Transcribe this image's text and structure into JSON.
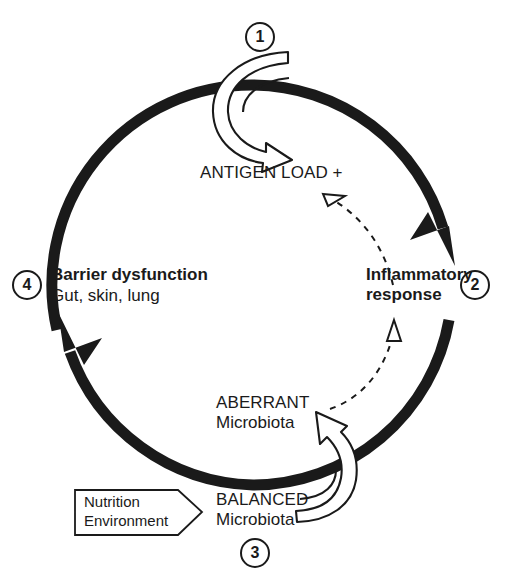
{
  "figure": {
    "type": "cycle-diagram",
    "background_color": "#ffffff",
    "ink_color": "#1a1a1a"
  },
  "steps": [
    {
      "number": "1",
      "label": "ANTIGEN LOAD +",
      "sublabel": "",
      "style": "caps",
      "position": "top"
    },
    {
      "number": "2",
      "label": "Inflammatory",
      "sublabel": "response",
      "style": "bold",
      "position": "right"
    },
    {
      "number": "3",
      "label": "BALANCED",
      "sublabel": "Microbiota",
      "style": "caps",
      "position": "bottom"
    },
    {
      "number": "4",
      "label": "Barrier dysfunction",
      "sublabel": "Gut, skin, lung",
      "style": "bold",
      "position": "left"
    }
  ],
  "nodes": {
    "antigen_load": "ANTIGEN LOAD +",
    "inflammatory_line1": "Inflammatory",
    "inflammatory_line2": "response",
    "aberrant_line1": "ABERRANT",
    "aberrant_line2": "Microbiota",
    "balanced_line1": "BALANCED",
    "balanced_line2": "Microbiota",
    "barrier_line1": "Barrier dysfunction",
    "barrier_line2": "Gut, skin, lung"
  },
  "input_box": {
    "line1": "Nutrition",
    "line2": "Environment",
    "shape": "arrow-right-pentagon"
  },
  "numbers": {
    "one": "1",
    "two": "2",
    "three": "3",
    "four": "4"
  },
  "arrows": [
    {
      "name": "main-cycle-ring",
      "style": "solid-thick",
      "direction": "clockwise",
      "description": "Thick black circular ring with arrowheads"
    },
    {
      "name": "antigen-load-inflow",
      "style": "outline-white-curved",
      "description": "Hooked arrow from step 1 down into ANTIGEN LOAD +"
    },
    {
      "name": "balanced-to-aberrant",
      "style": "outline-white-curved",
      "description": "Hooked arrow from BALANCED Microbiota up to ABERRANT Microbiota"
    },
    {
      "name": "inflammatory-to-antigen-feedback",
      "style": "dashed",
      "description": "Dashed feedback arrow from inflammatory response up to ANTIGEN LOAD +"
    },
    {
      "name": "aberrant-to-inflammatory-feedback",
      "style": "dashed",
      "description": "Dashed feedback arrow from ABERRANT Microbiota up to inflammatory response"
    }
  ]
}
